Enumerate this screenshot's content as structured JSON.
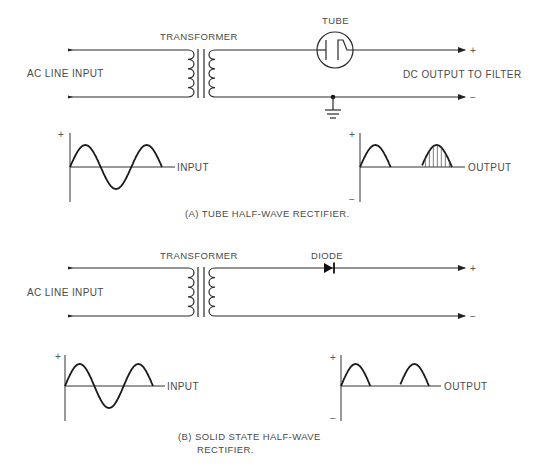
{
  "figure": {
    "section_a": {
      "caption": "(A)  TUBE HALF-WAVE RECTIFIER.",
      "input_label": "AC LINE INPUT",
      "transformer_label": "TRANSFORMER",
      "rectifier_label": "TUBE",
      "output_label": "DC OUTPUT TO FILTER",
      "plus_terminal": "+",
      "minus_terminal": "−",
      "has_ground": true,
      "input_graph": {
        "label": "INPUT",
        "pos_sign": "+",
        "waveform": "sine",
        "cycles": 1.5
      },
      "output_graph": {
        "label": "OUTPUT",
        "pos_sign": "+",
        "neg_sign": "−",
        "waveform": "half-wave rectified",
        "pulses": 2,
        "hatched_pulse": 2
      }
    },
    "section_b": {
      "caption_line1": "(B)  SOLID STATE HALF-WAVE",
      "caption_line2": "RECTIFIER.",
      "input_label": "AC LINE INPUT",
      "transformer_label": "TRANSFORMER",
      "rectifier_label": "DIODE",
      "plus_terminal": "+",
      "minus_terminal": "−",
      "input_graph": {
        "label": "INPUT",
        "pos_sign": "+",
        "waveform": "sine",
        "cycles": 1.5
      },
      "output_graph": {
        "label": "OUTPUT",
        "pos_sign": "+",
        "neg_sign": "−",
        "waveform": "half-wave rectified",
        "pulses": 2
      }
    }
  }
}
